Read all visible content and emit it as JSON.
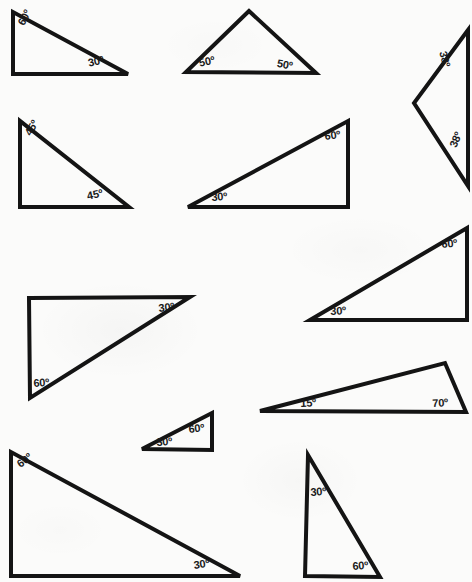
{
  "page": {
    "background_color": "#fbfbfa",
    "ink_color": "#141414",
    "degree_symbol": "º"
  },
  "figures": [
    {
      "id": "triangle-1",
      "name": "right-triangle-60-30-top-left",
      "vertices": [
        [
          13,
          12
        ],
        [
          13,
          74
        ],
        [
          128,
          74
        ]
      ],
      "stroke_width": 4,
      "labels": [
        {
          "text": "60º",
          "x": 16,
          "y": 22,
          "rotate": -62,
          "size": 11
        },
        {
          "text": "30º",
          "x": 87,
          "y": 58,
          "rotate": -13,
          "size": 11
        }
      ]
    },
    {
      "id": "triangle-2",
      "name": "isosceles-triangle-50-50-top-middle",
      "vertices": [
        [
          249,
          11
        ],
        [
          186,
          72
        ],
        [
          316,
          73
        ]
      ],
      "stroke_width": 4,
      "labels": [
        {
          "text": "50º",
          "x": 198,
          "y": 58,
          "rotate": -12,
          "size": 11
        },
        {
          "text": "50º",
          "x": 278,
          "y": 58,
          "rotate": 10,
          "size": 11
        }
      ]
    },
    {
      "id": "triangle-3",
      "name": "narrow-triangle-38-38-right",
      "vertices": [
        [
          468,
          30
        ],
        [
          414,
          103
        ],
        [
          468,
          186
        ]
      ],
      "stroke_width": 4,
      "labels": [
        {
          "text": "38º",
          "x": 448,
          "y": 50,
          "rotate": 76,
          "size": 11
        },
        {
          "text": "38º",
          "x": 448,
          "y": 145,
          "rotate": -68,
          "size": 11
        }
      ]
    },
    {
      "id": "triangle-4",
      "name": "right-triangle-45-45-left",
      "vertices": [
        [
          20,
          121
        ],
        [
          20,
          207
        ],
        [
          129,
          207
        ]
      ],
      "stroke_width": 4,
      "labels": [
        {
          "text": "45º",
          "x": 23,
          "y": 132,
          "rotate": -60,
          "size": 11
        },
        {
          "text": "45º",
          "x": 86,
          "y": 191,
          "rotate": -12,
          "size": 11
        }
      ]
    },
    {
      "id": "triangle-5",
      "name": "right-triangle-30-60-middle",
      "vertices": [
        [
          188,
          207
        ],
        [
          348,
          121
        ],
        [
          348,
          207
        ]
      ],
      "stroke_width": 4,
      "labels": [
        {
          "text": "30º",
          "x": 211,
          "y": 192,
          "rotate": -4,
          "size": 11
        },
        {
          "text": "60º",
          "x": 324,
          "y": 131,
          "rotate": -7,
          "size": 11
        }
      ]
    },
    {
      "id": "triangle-6",
      "name": "right-triangle-30-60-right-upper",
      "vertices": [
        [
          310,
          320
        ],
        [
          467,
          228
        ],
        [
          467,
          320
        ]
      ],
      "stroke_width": 4,
      "labels": [
        {
          "text": "30º",
          "x": 330,
          "y": 306,
          "rotate": -3,
          "size": 11
        },
        {
          "text": "60º",
          "x": 441,
          "y": 239,
          "rotate": -5,
          "size": 11
        }
      ]
    },
    {
      "id": "triangle-7",
      "name": "right-triangle-60-30-left-middle",
      "vertices": [
        [
          29,
          298
        ],
        [
          190,
          297
        ],
        [
          30,
          398
        ]
      ],
      "stroke_width": 4,
      "labels": [
        {
          "text": "30º",
          "x": 158,
          "y": 303,
          "rotate": -7,
          "size": 11
        },
        {
          "text": "60º",
          "x": 33,
          "y": 378,
          "rotate": -4,
          "size": 11
        }
      ]
    },
    {
      "id": "triangle-8",
      "name": "obtuse-triangle-15-70-right-middle",
      "vertices": [
        [
          260,
          411
        ],
        [
          445,
          363
        ],
        [
          466,
          412
        ]
      ],
      "stroke_width": 4,
      "labels": [
        {
          "text": "15º",
          "x": 300,
          "y": 398,
          "rotate": -3,
          "size": 11
        },
        {
          "text": "70º",
          "x": 432,
          "y": 398,
          "rotate": -3,
          "size": 11
        }
      ]
    },
    {
      "id": "triangle-9",
      "name": "small-right-triangle-30-60",
      "vertices": [
        [
          142,
          449
        ],
        [
          212,
          413
        ],
        [
          212,
          450
        ]
      ],
      "stroke_width": 4,
      "labels": [
        {
          "text": "30º",
          "x": 156,
          "y": 437,
          "rotate": -4,
          "size": 11
        },
        {
          "text": "60º",
          "x": 188,
          "y": 424,
          "rotate": -6,
          "size": 11
        }
      ]
    },
    {
      "id": "triangle-10",
      "name": "large-right-triangle-60-30-bottom-left",
      "vertices": [
        [
          11,
          452
        ],
        [
          11,
          576
        ],
        [
          240,
          576
        ]
      ],
      "stroke_width": 4,
      "labels": [
        {
          "text": "60º",
          "x": 15,
          "y": 461,
          "rotate": -38,
          "size": 11
        },
        {
          "text": "30º",
          "x": 193,
          "y": 560,
          "rotate": -8,
          "size": 11
        }
      ]
    },
    {
      "id": "triangle-11",
      "name": "right-triangle-30-60-bottom-right",
      "vertices": [
        [
          308,
          455
        ],
        [
          305,
          576
        ],
        [
          380,
          577
        ]
      ],
      "stroke_width": 4,
      "labels": [
        {
          "text": "30º",
          "x": 310,
          "y": 487,
          "rotate": -4,
          "size": 11
        },
        {
          "text": "60º",
          "x": 352,
          "y": 561,
          "rotate": -4,
          "size": 11
        }
      ]
    }
  ]
}
